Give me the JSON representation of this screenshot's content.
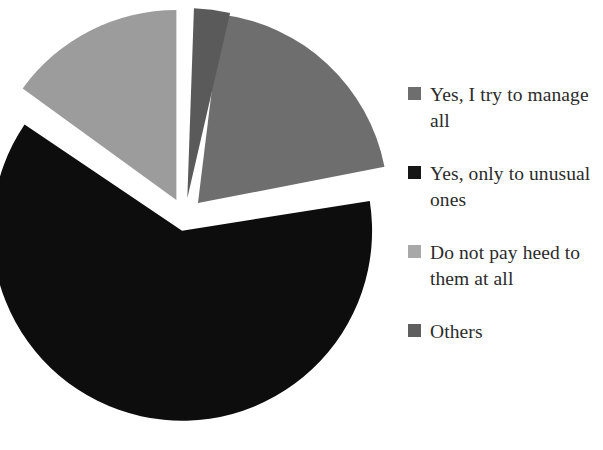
{
  "chart_data": {
    "type": "pie",
    "title": "",
    "subtitle": "",
    "xlabel": "",
    "ylabel": "",
    "grid": false,
    "legend_position": "right",
    "exploded": true,
    "start_angle_deg": -86,
    "labels": [
      "Yes, I try to manage all",
      "Yes, only to unusual ones",
      "Do not pay heed to them at all",
      "Others"
    ],
    "values": [
      20,
      62,
      15,
      3
    ],
    "units": "percent",
    "colors": [
      "#6e6e6e",
      "#0d0d0d",
      "#9c9c9c",
      "#5a5a5a"
    ],
    "slices": [
      {
        "label": "Yes, I try to manage all",
        "value": 20,
        "color": "#6e6e6e",
        "start_deg": -83,
        "end_deg": -11,
        "explode_deg": -47,
        "explode_px": 19
      },
      {
        "label": "Yes, only to unusual ones",
        "value": 62,
        "color": "#0d0d0d",
        "start_deg": -9,
        "end_deg": 214,
        "explode_deg": 102,
        "explode_px": 14
      },
      {
        "label": "Do not pay heed to them at all",
        "value": 15,
        "color": "#9c9c9c",
        "start_deg": 216,
        "end_deg": 270,
        "explode_deg": 243,
        "explode_px": 19
      },
      {
        "label": "Others",
        "value": 3,
        "color": "#5a5a5a",
        "start_deg": 272,
        "end_deg": 283,
        "explode_deg": 277,
        "explode_px": 19
      }
    ],
    "geometry": {
      "center_x": 185,
      "center_y": 217,
      "radius": 190
    }
  },
  "legend": {
    "items": [
      {
        "label": "Yes, I try to manage all",
        "color": "#6e6e6e"
      },
      {
        "label": "Yes, only to unusual ones",
        "color": "#161616"
      },
      {
        "label": "Do not pay heed to them at all",
        "color": "#a8a8a8"
      },
      {
        "label": "Others",
        "color": "#5f5f5f"
      }
    ]
  },
  "background": "#ffffff"
}
